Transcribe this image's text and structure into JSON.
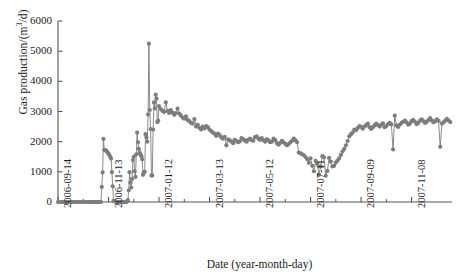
{
  "chart_data": {
    "type": "line",
    "title": "",
    "xlabel": "Date (year-month-day)",
    "ylabel": "Gas production/(m³/d)",
    "ylabel_parts": {
      "prefix": "Gas production/(m",
      "sup": "3",
      "suffix": "/d)"
    },
    "ylim": [
      0,
      6000
    ],
    "ytick_labels": [
      "0",
      "1000",
      "2000",
      "3000",
      "4000",
      "5000",
      "6000"
    ],
    "ytick_values": [
      0,
      1000,
      2000,
      3000,
      4000,
      5000,
      6000
    ],
    "xtick_labels": [
      "2006-09-14",
      "2006-11-13",
      "2007-01-12",
      "2007-03-13",
      "2007-05-12",
      "2007-07-11",
      "2007-09-09",
      "2007-11-08"
    ],
    "xtick_values": [
      0,
      60,
      120,
      180,
      240,
      300,
      360,
      420
    ],
    "xlim": [
      0,
      468
    ],
    "grid": false,
    "legend": null,
    "series_name": "Gas production",
    "marker": "circle",
    "marker_color": "#7d7d7d",
    "line_color": "#7d7d7d",
    "x": [
      0,
      2,
      4,
      6,
      8,
      10,
      12,
      14,
      16,
      18,
      20,
      22,
      24,
      26,
      28,
      30,
      32,
      34,
      35,
      36,
      37,
      38,
      39,
      40,
      41,
      42,
      43,
      44,
      45,
      46,
      47,
      48,
      49,
      50,
      51,
      52,
      53,
      54,
      55,
      56,
      57,
      58,
      59,
      60,
      61,
      62,
      63,
      64,
      65,
      66,
      67,
      68,
      69,
      70,
      71,
      72,
      73,
      74,
      75,
      76,
      77,
      78,
      79,
      80,
      81,
      82,
      83,
      84,
      85,
      86,
      87,
      88,
      89,
      90,
      91,
      92,
      93,
      94,
      95,
      96,
      97,
      98,
      99,
      100,
      101,
      102,
      103,
      104,
      105,
      106,
      107,
      108,
      109,
      110,
      111,
      112,
      113,
      114,
      115,
      116,
      117,
      118,
      119,
      120,
      122,
      124,
      126,
      128,
      130,
      132,
      134,
      136,
      138,
      140,
      142,
      144,
      146,
      148,
      150,
      152,
      154,
      156,
      158,
      160,
      162,
      164,
      166,
      168,
      170,
      172,
      174,
      176,
      178,
      180,
      182,
      184,
      186,
      188,
      190,
      192,
      194,
      196,
      198,
      200,
      202,
      204,
      206,
      208,
      210,
      212,
      214,
      216,
      218,
      220,
      222,
      224,
      226,
      228,
      230,
      232,
      234,
      236,
      238,
      240,
      242,
      244,
      246,
      248,
      250,
      252,
      254,
      256,
      258,
      260,
      262,
      264,
      266,
      268,
      270,
      272,
      274,
      276,
      278,
      280,
      282,
      284,
      286,
      288,
      290,
      292,
      294,
      296,
      298,
      300,
      302,
      304,
      306,
      308,
      310,
      312,
      314,
      316,
      318,
      320,
      322,
      324,
      326,
      328,
      330,
      332,
      334,
      336,
      338,
      340,
      342,
      344,
      346,
      348,
      350,
      352,
      354,
      356,
      358,
      360,
      362,
      364,
      366,
      368,
      370,
      372,
      374,
      376,
      378,
      380,
      382,
      384,
      386,
      388,
      390,
      392,
      394,
      396,
      398,
      400,
      402,
      404,
      406,
      408,
      410,
      412,
      414,
      416,
      418,
      420,
      422,
      424,
      426,
      428,
      430,
      432,
      434,
      436,
      438,
      440,
      442,
      444,
      446,
      448,
      450,
      452,
      454,
      456,
      458,
      460,
      462,
      464,
      466
    ],
    "y": [
      0,
      0,
      0,
      0,
      0,
      0,
      0,
      0,
      0,
      0,
      0,
      0,
      0,
      0,
      0,
      0,
      0,
      0,
      0,
      0,
      0,
      0,
      0,
      0,
      0,
      0,
      0,
      0,
      0,
      0,
      0,
      0,
      0,
      0,
      0,
      500,
      980,
      2090,
      1730,
      1720,
      1700,
      1680,
      1640,
      1600,
      1560,
      1500,
      1440,
      990,
      520,
      40,
      30,
      20,
      0,
      0,
      0,
      0,
      0,
      0,
      0,
      0,
      0,
      0,
      0,
      0,
      0,
      20,
      60,
      390,
      990,
      640,
      480,
      760,
      1390,
      1500,
      1020,
      830,
      1580,
      2300,
      1980,
      1760,
      1640,
      1580,
      1520,
      1420,
      900,
      980,
      1000,
      2250,
      2150,
      2000,
      2900,
      5250,
      3050,
      2420,
      880,
      880,
      2400,
      3300,
      3100,
      3560,
      3430,
      2650,
      2700,
      3180,
      3080,
      3020,
      2980,
      3300,
      3020,
      2950,
      3050,
      2960,
      2890,
      2950,
      3100,
      2930,
      2870,
      2800,
      2760,
      2840,
      2720,
      2680,
      2620,
      2600,
      2750,
      2500,
      2560,
      2460,
      2400,
      2500,
      2440,
      2520,
      2480,
      2400,
      2350,
      2300,
      2260,
      2190,
      2270,
      2220,
      2140,
      2100,
      2160,
      1880,
      2080,
      2040,
      2000,
      1950,
      2060,
      2020,
      1980,
      2010,
      2120,
      2080,
      2040,
      2000,
      2060,
      2100,
      2050,
      2030,
      2150,
      2180,
      2100,
      2060,
      2120,
      2050,
      2000,
      2080,
      2040,
      1980,
      2000,
      2100,
      2050,
      1950,
      1900,
      1960,
      2030,
      1980,
      1930,
      1880,
      1920,
      1980,
      2030,
      2100,
      2050,
      1980,
      1640,
      1620,
      1580,
      1550,
      1490,
      1420,
      1300,
      1450,
      1200,
      1020,
      1360,
      1260,
      900,
      1180,
      1520,
      1480,
      870,
      1030,
      1460,
      1340,
      1180,
      1200,
      1310,
      1370,
      1450,
      1560,
      1680,
      1760,
      1880,
      2020,
      2180,
      2250,
      2300,
      2400,
      2380,
      2450,
      2520,
      2490,
      2430,
      2500,
      2550,
      2600,
      2480,
      2420,
      2480,
      2540,
      2600,
      2550,
      2500,
      2560,
      2610,
      2480,
      2520,
      2580,
      2620,
      2570,
      1740,
      2860,
      2540,
      2490,
      2560,
      2620,
      2660,
      2700,
      2640,
      2560,
      2600,
      2680,
      2720,
      2660,
      2580,
      2620,
      2700,
      2740,
      2680,
      2620,
      2660,
      2720,
      2780,
      2700,
      2640,
      2680,
      2740,
      2690,
      1830,
      2600,
      2640,
      2700,
      2760,
      2700,
      2650,
      2690,
      2750,
      2800,
      2730,
      2680,
      2720,
      2780,
      2820,
      2760,
      2700,
      2740,
      2800,
      2850,
      2780,
      2730,
      2770,
      2830,
      2880,
      2820,
      2770,
      2800,
      2860,
      2910,
      2870,
      2900,
      2960,
      2880,
      2850,
      2900,
      2950
    ]
  }
}
